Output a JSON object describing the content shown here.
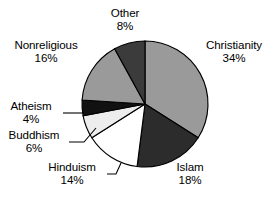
{
  "chart_data": {
    "type": "pie",
    "title": "",
    "subtitle": "",
    "xlabel": "",
    "ylabel": "",
    "grid": false,
    "legend_position": "none",
    "label_format": "name + percent",
    "start_angle_deg": 0,
    "direction": "clockwise",
    "total_percent": 100,
    "categories": [
      "Christianity",
      "Islam",
      "Hinduism",
      "Buddhism",
      "Atheism",
      "Nonreligious",
      "Other"
    ],
    "values": [
      34,
      18,
      14,
      6,
      4,
      16,
      8
    ],
    "slices": [
      {
        "label": "Christianity",
        "value": 34,
        "percent_text": "34%",
        "color": "#9a9a9a"
      },
      {
        "label": "Islam",
        "value": 18,
        "percent_text": "18%",
        "color": "#2c2c2c"
      },
      {
        "label": "Hinduism",
        "value": 14,
        "percent_text": "14%",
        "color": "#ffffff"
      },
      {
        "label": "Buddhism",
        "value": 6,
        "percent_text": "6%",
        "color": "#ededed"
      },
      {
        "label": "Atheism",
        "value": 4,
        "percent_text": "4%",
        "color": "#111111"
      },
      {
        "label": "Nonreligious",
        "value": 16,
        "percent_text": "16%",
        "color": "#9a9a9a"
      },
      {
        "label": "Other",
        "value": 8,
        "percent_text": "8%",
        "color": "#3b3b3b"
      }
    ]
  },
  "labels": {
    "other": {
      "name": "Other",
      "percent": "8%"
    },
    "christianity": {
      "name": "Christianity",
      "percent": "34%"
    },
    "islam": {
      "name": "Islam",
      "percent": "18%"
    },
    "hinduism": {
      "name": "Hinduism",
      "percent": "14%"
    },
    "buddhism": {
      "name": "Buddhism",
      "percent": "6%"
    },
    "atheism": {
      "name": "Atheism",
      "percent": "4%"
    },
    "nonreligious": {
      "name": "Nonreligious",
      "percent": "16%"
    }
  },
  "geometry": {
    "center_x": 145,
    "center_y": 104,
    "radius": 63
  }
}
